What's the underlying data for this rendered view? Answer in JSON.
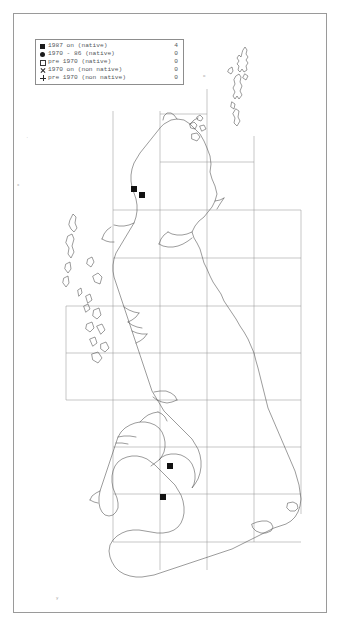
{
  "map": {
    "title": "Great Britain and Ireland distribution map",
    "region": "British Isles",
    "projection_grid": "Ordnance Survey 100 km grid",
    "background_color": "#ffffff",
    "frame_color": "#9a9a9a",
    "coastline_color": "#4a4a4a",
    "grid_color": "#8e8e8e",
    "marker_color": "#111111"
  },
  "legend": {
    "border_color": "#8d8d8d",
    "text_color": "#55585c",
    "rows": [
      {
        "marker": "filled-square",
        "label": "1987 on (native)",
        "count": "4"
      },
      {
        "marker": "filled-circle",
        "label": "1970 - 86 (native)",
        "count": "0"
      },
      {
        "marker": "open-square",
        "label": "pre 1970 (native)",
        "count": "0"
      },
      {
        "marker": "cross-x",
        "label": "1970 on (non native)",
        "count": "0"
      },
      {
        "marker": "plus",
        "label": "pre 1970 (non native)",
        "count": "0"
      }
    ]
  },
  "records": {
    "total": 4,
    "points": [
      {
        "class": "1987 on (native)",
        "marker": "filled-square",
        "x": 131,
        "y": 186,
        "area": "Scotland - Moray Firth"
      },
      {
        "class": "1987 on (native)",
        "marker": "filled-square",
        "x": 139,
        "y": 192,
        "area": "Scotland - Moray Firth"
      },
      {
        "class": "1987 on (native)",
        "marker": "filled-square",
        "x": 167,
        "y": 463,
        "area": "Welsh Marches north"
      },
      {
        "class": "1987 on (native)",
        "marker": "filled-square",
        "x": 160,
        "y": 494,
        "area": "Welsh Marches south"
      }
    ]
  }
}
